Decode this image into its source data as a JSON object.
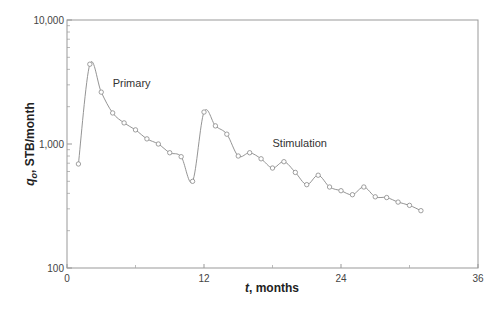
{
  "chart_data": {
    "type": "line",
    "title": "",
    "xlabel_var": "t",
    "xlabel_rest": ", months",
    "ylabel_var": "q",
    "ylabel_sub": "o",
    "ylabel_rest": ", STB/month",
    "xlim": [
      0,
      36
    ],
    "ylim": [
      100,
      10000
    ],
    "yscale": "log",
    "grid": false,
    "x_ticks": [
      0,
      12,
      24,
      36
    ],
    "x_tick_labels": [
      "0",
      "12",
      "24",
      "36"
    ],
    "x_minor_ticks": [
      6,
      18,
      30
    ],
    "y_ticks": [
      100,
      1000,
      10000
    ],
    "y_tick_labels": [
      "100",
      "1,000",
      "10,000"
    ],
    "annotations": [
      {
        "text": "Primary",
        "x": 4,
        "y": 2900
      },
      {
        "text": "Stimulation",
        "x": 18,
        "y": 950
      }
    ],
    "series": [
      {
        "name": "Oil rate",
        "marker": "open-circle",
        "color": "#888888",
        "x": [
          1,
          2,
          3,
          4,
          5,
          6,
          7,
          8,
          9,
          10,
          11,
          12,
          13,
          14,
          15,
          16,
          17,
          18,
          19,
          20,
          21,
          22,
          23,
          24,
          25,
          26,
          27,
          28,
          29,
          30,
          31
        ],
        "values": [
          690,
          4400,
          2620,
          1780,
          1480,
          1300,
          1100,
          1000,
          850,
          790,
          500,
          1810,
          1400,
          1200,
          800,
          850,
          760,
          640,
          720,
          590,
          470,
          560,
          450,
          420,
          390,
          450,
          375,
          370,
          340,
          320,
          290
        ]
      }
    ]
  }
}
